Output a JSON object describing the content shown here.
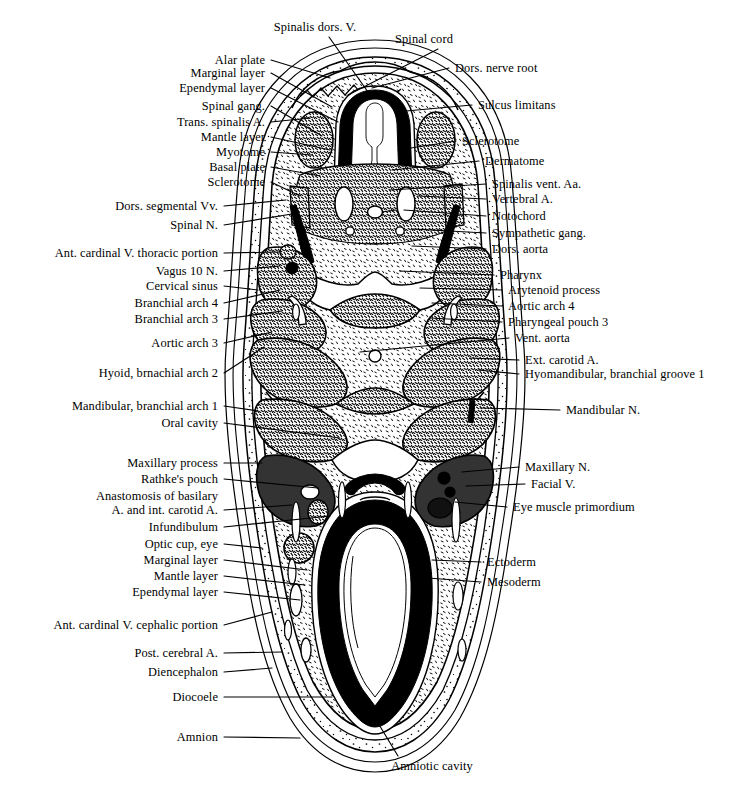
{
  "figure": {
    "type": "labeled-anatomical-diagram",
    "background_color": "#ffffff",
    "ink_color": "#000000"
  },
  "labels_left": [
    {
      "text": "Alar plate",
      "x": 265,
      "y": 60,
      "lead_to_x": 330,
      "lead_to_y": 78
    },
    {
      "text": "Marginal layer",
      "x": 265,
      "y": 73,
      "lead_to_x": 332,
      "lead_to_y": 107
    },
    {
      "text": "Ependymal layer",
      "x": 265,
      "y": 88,
      "lead_to_x": 338,
      "lead_to_y": 122
    },
    {
      "text": "Spinal gang.",
      "x": 265,
      "y": 106,
      "lead_to_x": 322,
      "lead_to_y": 136
    },
    {
      "text": "Trans. spinalis A.",
      "x": 265,
      "y": 122,
      "lead_to_x": 310,
      "lead_to_y": 118
    },
    {
      "text": "Mantle layer",
      "x": 265,
      "y": 137,
      "lead_to_x": 330,
      "lead_to_y": 150
    },
    {
      "text": "Myotome",
      "x": 265,
      "y": 152,
      "lead_to_x": 312,
      "lead_to_y": 155
    },
    {
      "text": "Basal plate",
      "x": 265,
      "y": 167,
      "lead_to_x": 320,
      "lead_to_y": 176
    },
    {
      "text": "Sclerotome",
      "x": 265,
      "y": 182,
      "lead_to_x": 300,
      "lead_to_y": 196
    },
    {
      "text": "Dors. segmental Vv.",
      "x": 218,
      "y": 206,
      "lead_to_x": 286,
      "lead_to_y": 200
    },
    {
      "text": "Spinal N.",
      "x": 218,
      "y": 225,
      "lead_to_x": 292,
      "lead_to_y": 214
    },
    {
      "text": "Ant. cardinal V. thoracic portion",
      "x": 218,
      "y": 253,
      "lead_to_x": 281,
      "lead_to_y": 252
    },
    {
      "text": "Vagus 10 N.",
      "x": 218,
      "y": 271,
      "lead_to_x": 280,
      "lead_to_y": 266
    },
    {
      "text": "Cervical sinus",
      "x": 218,
      "y": 286,
      "lead_to_x": 258,
      "lead_to_y": 290
    },
    {
      "text": "Branchial arch 4",
      "x": 218,
      "y": 303,
      "lead_to_x": 280,
      "lead_to_y": 290
    },
    {
      "text": "Branchial arch 3",
      "x": 218,
      "y": 319,
      "lead_to_x": 282,
      "lead_to_y": 311
    },
    {
      "text": "Aortic arch 3",
      "x": 218,
      "y": 343,
      "lead_to_x": 272,
      "lead_to_y": 332
    },
    {
      "text": "Hyoid, brnachial arch 2",
      "x": 218,
      "y": 373,
      "lead_to_x": 264,
      "lead_to_y": 347
    },
    {
      "text": "Mandibular, branchial arch 1",
      "x": 218,
      "y": 406,
      "lead_to_x": 258,
      "lead_to_y": 411
    },
    {
      "text": "Oral cavity",
      "x": 218,
      "y": 423,
      "lead_to_x": 340,
      "lead_to_y": 438
    },
    {
      "text": "Maxillary process",
      "x": 218,
      "y": 463,
      "lead_to_x": 262,
      "lead_to_y": 463
    },
    {
      "text": "Rathke's pouch",
      "x": 218,
      "y": 479,
      "lead_to_x": 318,
      "lead_to_y": 488
    },
    {
      "text": "Anastomosis of basilary",
      "x": 218,
      "y": 496,
      "lead_to_x": 0,
      "lead_to_y": 0
    },
    {
      "text": "A. and int. carotid A.",
      "x": 218,
      "y": 510,
      "lead_to_x": 292,
      "lead_to_y": 505
    },
    {
      "text": "Infundibulum",
      "x": 218,
      "y": 527,
      "lead_to_x": 330,
      "lead_to_y": 516
    },
    {
      "text": "Optic cup, eye",
      "x": 218,
      "y": 544,
      "lead_to_x": 262,
      "lead_to_y": 548
    },
    {
      "text": "Marginal layer",
      "x": 218,
      "y": 560,
      "lead_to_x": 307,
      "lead_to_y": 570
    },
    {
      "text": "Mantle layer",
      "x": 218,
      "y": 576,
      "lead_to_x": 305,
      "lead_to_y": 585
    },
    {
      "text": "Ependymal layer",
      "x": 218,
      "y": 592,
      "lead_to_x": 300,
      "lead_to_y": 600
    },
    {
      "text": "Ant. cardinal V. cephalic portion",
      "x": 218,
      "y": 625,
      "lead_to_x": 272,
      "lead_to_y": 612
    },
    {
      "text": "Post. cerebral A.",
      "x": 218,
      "y": 653,
      "lead_to_x": 282,
      "lead_to_y": 652
    },
    {
      "text": "Diencephalon",
      "x": 218,
      "y": 672,
      "lead_to_x": 272,
      "lead_to_y": 668
    },
    {
      "text": "Diocoele",
      "x": 218,
      "y": 697,
      "lead_to_x": 332,
      "lead_to_y": 697
    },
    {
      "text": "Amnion",
      "x": 218,
      "y": 737,
      "lead_to_x": 300,
      "lead_to_y": 738
    }
  ],
  "labels_right": [
    {
      "text": "Dors. nerve root",
      "x": 455,
      "y": 68,
      "lead_to_x": 372,
      "lead_to_y": 88
    },
    {
      "text": "Sulcus limitans",
      "x": 478,
      "y": 105,
      "lead_to_x": 395,
      "lead_to_y": 112
    },
    {
      "text": "Sclerotome",
      "x": 462,
      "y": 141,
      "lead_to_x": 398,
      "lead_to_y": 150
    },
    {
      "text": "Dermatome",
      "x": 485,
      "y": 161,
      "lead_to_x": 392,
      "lead_to_y": 170
    },
    {
      "text": "Spinalis vent. Aa.",
      "x": 492,
      "y": 184,
      "lead_to_x": 390,
      "lead_to_y": 190
    },
    {
      "text": "Vertebral A.",
      "x": 492,
      "y": 199,
      "lead_to_x": 418,
      "lead_to_y": 196
    },
    {
      "text": "Notochord",
      "x": 492,
      "y": 216,
      "lead_to_x": 404,
      "lead_to_y": 210
    },
    {
      "text": "Sympathetic gang.",
      "x": 492,
      "y": 233,
      "lead_to_x": 412,
      "lead_to_y": 229
    },
    {
      "text": "Dors. aorta",
      "x": 492,
      "y": 249,
      "lead_to_x": 412,
      "lead_to_y": 246
    },
    {
      "text": "Pharynx",
      "x": 500,
      "y": 275,
      "lead_to_x": 400,
      "lead_to_y": 271
    },
    {
      "text": "Arytenoid process",
      "x": 508,
      "y": 290,
      "lead_to_x": 420,
      "lead_to_y": 288
    },
    {
      "text": "Aortic arch 4",
      "x": 508,
      "y": 306,
      "lead_to_x": 432,
      "lead_to_y": 303
    },
    {
      "text": "Pharyngeal pouch 3",
      "x": 508,
      "y": 322,
      "lead_to_x": 430,
      "lead_to_y": 318
    },
    {
      "text": "Vent. aorta",
      "x": 515,
      "y": 338,
      "lead_to_x": 360,
      "lead_to_y": 352
    },
    {
      "text": "Ext. carotid A.",
      "x": 525,
      "y": 360,
      "lead_to_x": 470,
      "lead_to_y": 358
    },
    {
      "text": "Hyomandibular, branchial groove 1",
      "x": 525,
      "y": 374,
      "lead_to_x": 478,
      "lead_to_y": 370
    },
    {
      "text": "Mandibular N.",
      "x": 566,
      "y": 410,
      "lead_to_x": 480,
      "lead_to_y": 408
    },
    {
      "text": "Maxillary N.",
      "x": 525,
      "y": 467,
      "lead_to_x": 462,
      "lead_to_y": 472
    },
    {
      "text": "Facial V.",
      "x": 531,
      "y": 484,
      "lead_to_x": 466,
      "lead_to_y": 486
    },
    {
      "text": "Eye muscle primordium",
      "x": 513,
      "y": 507,
      "lead_to_x": 455,
      "lead_to_y": 502
    },
    {
      "text": "Ectoderm",
      "x": 487,
      "y": 562,
      "lead_to_x": 432,
      "lead_to_y": 560
    },
    {
      "text": "Mesoderm",
      "x": 487,
      "y": 582,
      "lead_to_x": 428,
      "lead_to_y": 578
    }
  ],
  "labels_top": [
    {
      "text": "Spinalis dors. V.",
      "x": 315,
      "y": 27,
      "lead_to_x": 368,
      "lead_to_y": 92
    },
    {
      "text": "Spinal cord",
      "x": 424,
      "y": 39,
      "lead_to_x": 348,
      "lead_to_y": 95
    }
  ],
  "labels_bottom": [
    {
      "text": "Amniotic cavity",
      "x": 432,
      "y": 766,
      "lead_to_x": 378,
      "lead_to_y": 723
    }
  ]
}
